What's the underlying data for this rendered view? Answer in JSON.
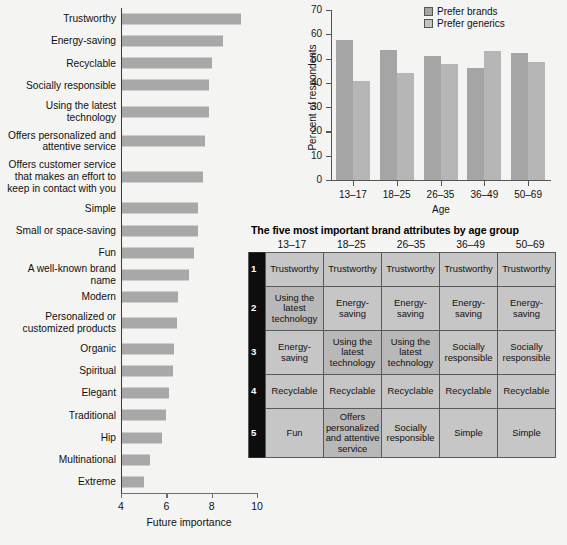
{
  "chart_data": [
    {
      "type": "bar",
      "orientation": "horizontal",
      "title": "",
      "xlabel": "Future importance",
      "ylabel": "",
      "xlim": [
        4,
        10
      ],
      "xticks": [
        4,
        6,
        8,
        10
      ],
      "grid": false,
      "categories": [
        "Trustworthy",
        "Energy-saving",
        "Recyclable",
        "Socially responsible",
        "Using the latest\ntechnology",
        "Offers personalized and\nattentive service",
        "Offers customer service\nthat makes an effort to\nkeep in contact with you",
        "Simple",
        "Small or space-saving",
        "Fun",
        "A well-known brand name",
        "Modern",
        "Personalized or\ncustomized products",
        "Organic",
        "Spiritual",
        "Elegant",
        "Traditional",
        "Hip",
        "Multinational",
        "Extreme"
      ],
      "values": [
        9.3,
        8.5,
        8.0,
        7.9,
        7.9,
        7.7,
        7.6,
        7.4,
        7.4,
        7.2,
        7.0,
        6.5,
        6.45,
        6.35,
        6.3,
        6.1,
        6.0,
        5.8,
        5.3,
        5.0
      ]
    },
    {
      "type": "bar",
      "orientation": "vertical",
      "title": "",
      "xlabel": "Age",
      "ylabel": "Per cent of respondents",
      "ylim": [
        0,
        70
      ],
      "yticks": [
        0,
        10,
        20,
        30,
        40,
        50,
        60,
        70
      ],
      "grid": false,
      "legend_position": "top-right",
      "categories": [
        "13–17",
        "18–25",
        "26–35",
        "36–49",
        "50–69"
      ],
      "series": [
        {
          "name": "Prefer brands",
          "values": [
            57.8,
            53.5,
            51.2,
            46.2,
            52.2
          ]
        },
        {
          "name": "Prefer generics",
          "values": [
            40.8,
            44.2,
            47.9,
            53.1,
            48.5
          ]
        }
      ]
    }
  ],
  "hbar": {
    "axis_title": "Future importance",
    "ticks": [
      "4",
      "6",
      "8",
      "10"
    ],
    "bars": [
      {
        "label": "Trustworthy",
        "value": 9.3
      },
      {
        "label": "Energy-saving",
        "value": 8.5
      },
      {
        "label": "Recyclable",
        "value": 8.0
      },
      {
        "label": "Socially responsible",
        "value": 7.9
      },
      {
        "label": "Using the latest\ntechnology",
        "value": 7.9
      },
      {
        "label": "Offers personalized and\nattentive service",
        "value": 7.7
      },
      {
        "label": "Offers customer service\nthat makes an effort to\nkeep in contact with you",
        "value": 7.6
      },
      {
        "label": "Simple",
        "value": 7.4
      },
      {
        "label": "Small or space-saving",
        "value": 7.4
      },
      {
        "label": "Fun",
        "value": 7.2
      },
      {
        "label": "A well-known brand name",
        "value": 7.0
      },
      {
        "label": "Modern",
        "value": 6.5
      },
      {
        "label": "Personalized or\ncustomized products",
        "value": 6.45
      },
      {
        "label": "Organic",
        "value": 6.35
      },
      {
        "label": "Spiritual",
        "value": 6.3
      },
      {
        "label": "Elegant",
        "value": 6.1
      },
      {
        "label": "Traditional",
        "value": 6.0
      },
      {
        "label": "Hip",
        "value": 5.8
      },
      {
        "label": "Multinational",
        "value": 5.3
      },
      {
        "label": "Extreme",
        "value": 5.0
      }
    ]
  },
  "vbar": {
    "y_title": "Per cent of respondents",
    "x_title": "Age",
    "yticks": [
      "0",
      "10",
      "20",
      "30",
      "40",
      "50",
      "60",
      "70"
    ],
    "xticklabels": [
      "13–17",
      "18–25",
      "26–35",
      "36–49",
      "50–69"
    ],
    "legend": [
      {
        "label": "Prefer brands",
        "color": "#a5a5a5"
      },
      {
        "label": "Prefer generics",
        "color": "#c4c4c4"
      }
    ],
    "groups": [
      {
        "age": "13–17",
        "brands": 57.8,
        "generics": 40.8
      },
      {
        "age": "18–25",
        "brands": 53.5,
        "generics": 44.2
      },
      {
        "age": "26–35",
        "brands": 51.2,
        "generics": 47.9
      },
      {
        "age": "36–49",
        "brands": 46.2,
        "generics": 53.1
      },
      {
        "age": "50–69",
        "brands": 52.2,
        "generics": 48.5
      }
    ]
  },
  "table": {
    "title": "The five most important brand attributes by age group",
    "columns": [
      "13–17",
      "18–25",
      "26–35",
      "36–49",
      "50–69"
    ],
    "rows": [
      {
        "rank": "1",
        "cells": [
          "Trustworthy",
          "Trustworthy",
          "Trustworthy",
          "Trustworthy",
          "Trustworthy"
        ]
      },
      {
        "rank": "2",
        "cells": [
          "Using the latest technology",
          "Energy-saving",
          "Energy-saving",
          "Energy-saving",
          "Energy-saving"
        ]
      },
      {
        "rank": "3",
        "cells": [
          "Energy-saving",
          "Using the latest technology",
          "Using the latest technology",
          "Socially responsible",
          "Socially responsible"
        ]
      },
      {
        "rank": "4",
        "cells": [
          "Recyclable",
          "Recyclable",
          "Recyclable",
          "Recyclable",
          "Recyclable"
        ]
      },
      {
        "rank": "5",
        "cells": [
          "Fun",
          "Offers personalized and attentive service",
          "Socially responsible",
          "Simple",
          "Simple"
        ]
      }
    ]
  },
  "colors": {
    "bar_fill": "#a8a8a8",
    "series_brands": "#a5a5a5",
    "series_generics": "#b6b6b6",
    "table_cell": "#c6c6c6",
    "table_cell_alt": "#b8b8b8",
    "rank_col": "#0d0d0d",
    "background": "#f4f4f2"
  }
}
